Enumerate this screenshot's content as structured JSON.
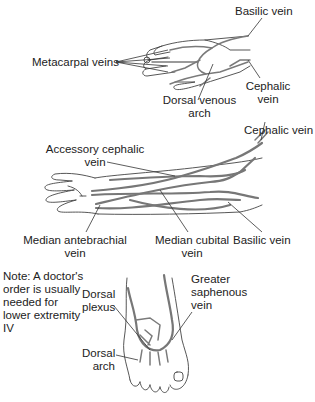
{
  "figure": {
    "hand": {
      "labels": {
        "basilic": "Basilic vein",
        "metacarpal": "Metacarpal veins",
        "dorsal_arch_1": "Dorsal venous",
        "dorsal_arch_2": "arch",
        "cephalic_1": "Cephalic",
        "cephalic_2": "vein"
      }
    },
    "forearm": {
      "labels": {
        "cephalic": "Cephalic vein",
        "accessory_1": "Accessory cephalic",
        "accessory_2": "vein",
        "median_ante_1": "Median antebrachial",
        "median_ante_2": "vein",
        "median_cubital_1": "Median cubital",
        "median_cubital_2": "vein",
        "basilic": "Basilic vein"
      }
    },
    "foot": {
      "note": [
        "Note: A doctor's",
        "order is usually",
        "needed for",
        "lower extremity",
        "IV"
      ],
      "labels": {
        "plexus_1": "Dorsal",
        "plexus_2": "plexus",
        "arch_1": "Dorsal",
        "arch_2": "arch",
        "saphenous_1": "Greater",
        "saphenous_2": "saphenous",
        "saphenous_3": "vein"
      }
    }
  }
}
